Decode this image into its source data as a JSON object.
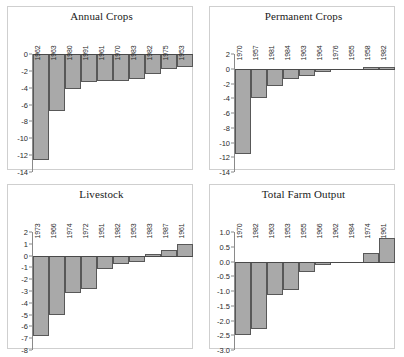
{
  "figure": {
    "layout": "2x2-grid",
    "bar_fill": "#a9a9a9",
    "bar_stroke": "#585858",
    "panel_border": "#cfcfcf",
    "background": "#ffffff"
  },
  "chart_data": [
    {
      "type": "bar",
      "title": "Annual Crops",
      "xlabel": "",
      "ylabel": "",
      "categories": [
        "1962",
        "1963",
        "1980",
        "1991",
        "1961",
        "1970",
        "1983",
        "1982",
        "1975",
        "1953"
      ],
      "values": [
        -12.6,
        -6.8,
        -4.2,
        -3.3,
        -3.2,
        -3.2,
        -3.0,
        -2.4,
        -1.8,
        -1.5
      ],
      "ylim": [
        -14,
        0
      ],
      "yticks": [
        0,
        -2,
        -4,
        -6,
        -8,
        -10,
        -12,
        -14
      ],
      "ytick_labels": [
        "0",
        "-2",
        "-4",
        "-6",
        "-8",
        "-10",
        "-12",
        "-14"
      ],
      "grid": false,
      "legend": "none"
    },
    {
      "type": "bar",
      "title": "Permanent Crops",
      "xlabel": "",
      "ylabel": "",
      "categories": [
        "1970",
        "1957",
        "1981",
        "1984",
        "1963",
        "1964",
        "1976",
        "1955",
        "1958",
        "1982"
      ],
      "values": [
        -11.5,
        -4.0,
        -2.3,
        -1.4,
        -1.0,
        -0.5,
        -0.2,
        -0.05,
        0.3,
        0.3
      ],
      "ylim": [
        -14,
        2
      ],
      "yticks": [
        2,
        0,
        -2,
        -4,
        -6,
        -8,
        -10,
        -12,
        -14
      ],
      "ytick_labels": [
        "2",
        "0",
        "-2",
        "-4",
        "-6",
        "-8",
        "-10",
        "-12",
        "-14"
      ],
      "grid": false,
      "legend": "none"
    },
    {
      "type": "bar",
      "title": "Livestock",
      "xlabel": "",
      "ylabel": "",
      "categories": [
        "1973",
        "1966",
        "1974",
        "1972",
        "1951",
        "1982",
        "1953",
        "1983",
        "1987",
        "1961"
      ],
      "values": [
        -6.8,
        -5.0,
        -3.2,
        -2.8,
        -1.1,
        -0.7,
        -0.5,
        0.1,
        0.5,
        1.0
      ],
      "ylim": [
        -8,
        2
      ],
      "yticks": [
        2,
        1,
        0,
        -1,
        -2,
        -3,
        -4,
        -5,
        -6,
        -7,
        -8
      ],
      "ytick_labels": [
        "2",
        "1",
        "0",
        "-1",
        "-2",
        "-3",
        "-4",
        "-5",
        "-6",
        "-7",
        "-8"
      ],
      "grid": false,
      "legend": "none"
    },
    {
      "type": "bar",
      "title": "Total Farm Output",
      "xlabel": "",
      "ylabel": "",
      "categories": [
        "1970",
        "1982",
        "1963",
        "1953",
        "1955",
        "1966",
        "1962",
        "1984",
        "1974",
        "1961"
      ],
      "values": [
        -2.5,
        -2.3,
        -1.15,
        -0.98,
        -0.35,
        -0.12,
        -0.03,
        -0.01,
        0.3,
        0.8
      ],
      "ylim": [
        -3.0,
        1.0
      ],
      "yticks": [
        1.0,
        0.5,
        0.0,
        -0.5,
        -1.0,
        -1.5,
        -2.0,
        -2.5,
        -3.0
      ],
      "ytick_labels": [
        "1.0",
        "0.5",
        "0.0",
        "-0.5",
        "-1.0",
        "-1.5",
        "-2.0",
        "-2.5",
        "-3.0"
      ],
      "grid": false,
      "legend": "none"
    }
  ]
}
